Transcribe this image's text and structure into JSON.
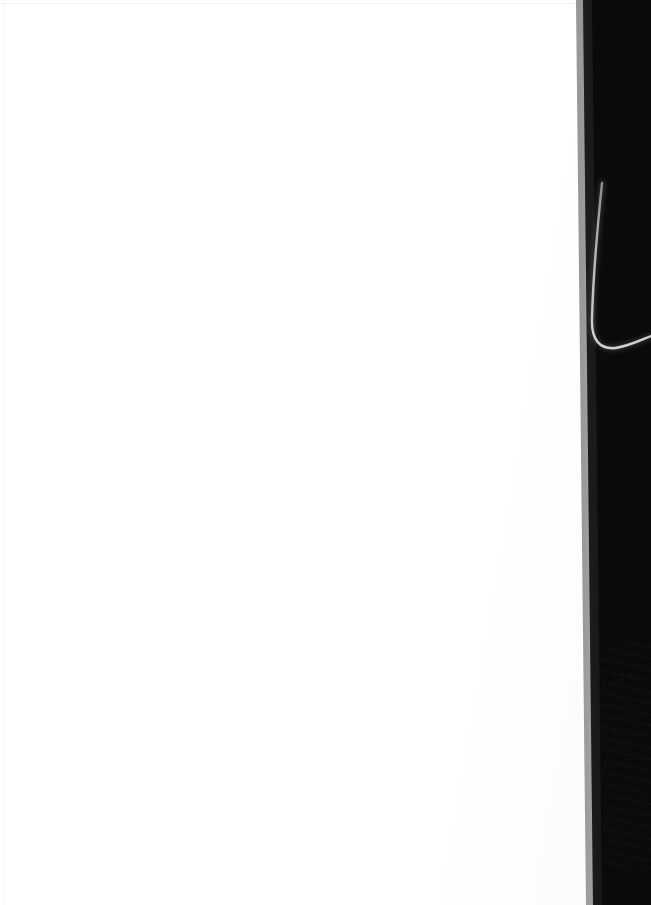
{
  "scene": {
    "width": 651,
    "height": 905,
    "description": "Photograph of the right-hand edge of a blank white page against a dark background, with a pale cable curving through the dark area"
  },
  "regions": {
    "paper": {
      "label": "blank-white-page",
      "color": "#ffffff",
      "edge_line_color": "#f0f0f0"
    },
    "dark_background": {
      "label": "dark-background-band",
      "color": "#0b0b0b",
      "highlight_color": "#1c1c1e",
      "left_edge_top_x": 583,
      "left_edge_bottom_x": 593
    }
  },
  "objects": {
    "cable": {
      "label": "pale-cable",
      "color": "#b9b9b9",
      "path_points": [
        [
          602,
          183
        ],
        [
          597,
          240
        ],
        [
          592,
          300
        ],
        [
          592,
          330
        ],
        [
          600,
          348
        ],
        [
          616,
          348
        ],
        [
          634,
          340
        ],
        [
          651,
          336
        ]
      ]
    }
  },
  "palette": {
    "paper_white": "#ffffff",
    "near_black": "#0b0b0b",
    "shadow_gray": "#1c1c1e",
    "cable_gray": "#b9b9b9",
    "edge_gray": "#f0f0f0"
  }
}
